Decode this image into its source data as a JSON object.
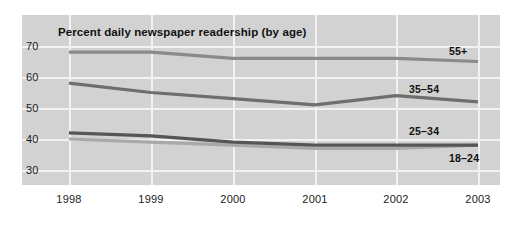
{
  "chart_data": {
    "type": "line",
    "title": "Percent daily newspaper readership (by age)",
    "xlabel": "",
    "ylabel": "",
    "x": [
      "1998",
      "1999",
      "2000",
      "2001",
      "2002",
      "2003"
    ],
    "categories": [
      "1998",
      "1999",
      "2000",
      "2001",
      "2002",
      "2003"
    ],
    "yticks": [
      "70",
      "60",
      "50",
      "40",
      "30"
    ],
    "ylim": [
      25,
      75
    ],
    "grid": "both",
    "legend_position": "inline-end-of-line",
    "series": [
      {
        "name": "55+",
        "label": "55+",
        "color": "#8a8a8a",
        "values": [
          68,
          68,
          66,
          66,
          66,
          65
        ]
      },
      {
        "name": "35-54",
        "label": "35–54",
        "color": "#6e6e6e",
        "values": [
          58,
          55,
          53,
          51,
          54,
          52
        ]
      },
      {
        "name": "25-34",
        "label": "25–34",
        "color": "#555555",
        "values": [
          42,
          41,
          39,
          38,
          38,
          38
        ]
      },
      {
        "name": "18-24",
        "label": "18–24",
        "color": "#a8a8a8",
        "values": [
          40,
          39,
          38,
          37,
          37,
          38
        ]
      }
    ]
  },
  "colors": {
    "panel_background": "#d2d2d2",
    "gridline": "#f2f2f2",
    "page_background": "#ffffff",
    "text": "#111111"
  },
  "axis": {
    "x_labels": [
      "1998",
      "1999",
      "2000",
      "2001",
      "2002",
      "2003"
    ],
    "y_labels": [
      "70",
      "60",
      "50",
      "40",
      "30"
    ]
  },
  "series_labels": {
    "s0": "55+",
    "s1": "35–54",
    "s2": "25–34",
    "s3": "18–24"
  }
}
